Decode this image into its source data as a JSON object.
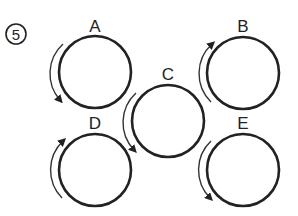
{
  "problem": {
    "number": "5"
  },
  "wheels": [
    {
      "label": "A",
      "cx": 95,
      "cy": 72,
      "r": 36,
      "arrow_direction": "down"
    },
    {
      "label": "B",
      "cx": 243,
      "cy": 73,
      "r": 36,
      "arrow_direction": "up"
    },
    {
      "label": "C",
      "cx": 168,
      "cy": 121,
      "r": 36,
      "arrow_direction": "down"
    },
    {
      "label": "D",
      "cx": 95,
      "cy": 170,
      "r": 36,
      "arrow_direction": "up"
    },
    {
      "label": "E",
      "cx": 243,
      "cy": 170,
      "r": 36,
      "arrow_direction": "down"
    }
  ],
  "colors": {
    "stroke": "#222222",
    "background": "#ffffff"
  }
}
